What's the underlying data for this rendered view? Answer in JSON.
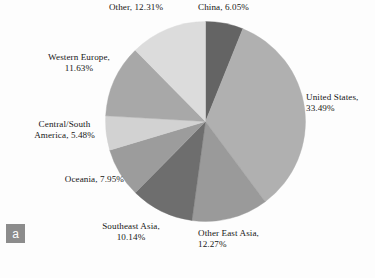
{
  "figure": {
    "panel_label": "a",
    "background_color": "#fdfdfd"
  },
  "chart_data": {
    "type": "pie",
    "title": "",
    "start_angle_deg": 0,
    "direction": "clockwise",
    "legend_position": "external-labels",
    "units": "percent",
    "categories": [
      "China",
      "United States",
      "Other East Asia",
      "Southeast Asia",
      "Oceania",
      "Central/South America",
      "Western Europe",
      "Other"
    ],
    "values": [
      6.05,
      33.49,
      12.27,
      10.14,
      7.95,
      5.48,
      11.63,
      12.31
    ],
    "colors": [
      "#646464",
      "#b0b0b0",
      "#9a9a9a",
      "#6e6e6e",
      "#9c9c9c",
      "#d2d2d2",
      "#a8a8a8",
      "#dcdcdc"
    ],
    "slices": [
      {
        "label": "China",
        "value": 6.05,
        "display": "China, 6.05%",
        "color": "#646464"
      },
      {
        "label": "United States",
        "value": 33.49,
        "display": "United States,\n33.49%",
        "color": "#b0b0b0"
      },
      {
        "label": "Other East Asia",
        "value": 12.27,
        "display": "Other East Asia,\n12.27%",
        "color": "#9a9a9a"
      },
      {
        "label": "Southeast Asia",
        "value": 10.14,
        "display": "Southeast Asia,\n10.14%",
        "color": "#6e6e6e"
      },
      {
        "label": "Oceania",
        "value": 7.95,
        "display": "Oceania, 7.95%",
        "color": "#9c9c9c"
      },
      {
        "label": "Central/South America",
        "value": 5.48,
        "display": "Central/South\nAmerica, 5.48%",
        "color": "#d2d2d2"
      },
      {
        "label": "Western Europe",
        "value": 11.63,
        "display": "Western Europe,\n11.63%",
        "color": "#a8a8a8"
      },
      {
        "label": "Other",
        "value": 12.31,
        "display": "Other, 12.31%",
        "color": "#dcdcdc"
      }
    ]
  }
}
